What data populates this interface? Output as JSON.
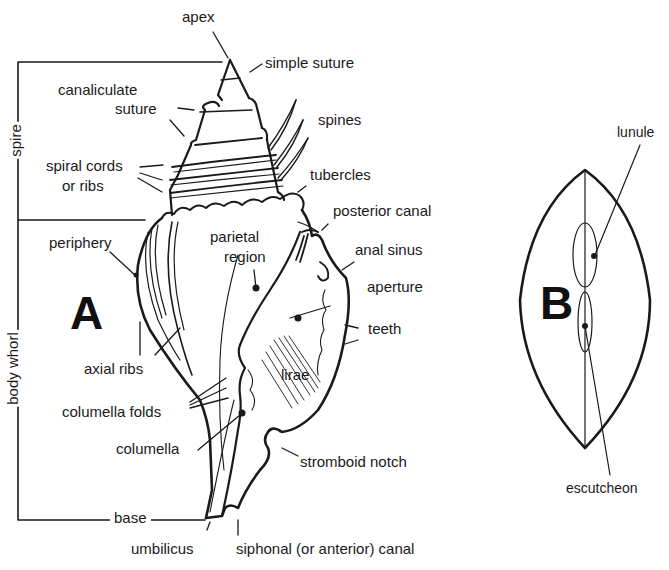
{
  "figure": {
    "panel_a": {
      "letter": "A",
      "labels": {
        "apex": "apex",
        "simple_suture": "simple suture",
        "canaliculate_suture_1": "canaliculate",
        "canaliculate_suture_2": "suture",
        "spines": "spines",
        "spiral_cords_1": "spiral cords",
        "spiral_cords_2": "or ribs",
        "tubercles": "tubercles",
        "posterior_canal": "posterior canal",
        "periphery": "periphery",
        "parietal_region_1": "parietal",
        "parietal_region_2": "region",
        "anal_sinus": "anal sinus",
        "aperture": "aperture",
        "teeth": "teeth",
        "axial_ribs": "axial ribs",
        "lirae": "lirae",
        "columella_folds": "columella folds",
        "columella": "columella",
        "stromboid_notch": "stromboid notch",
        "base": "base",
        "umbilicus": "umbilicus",
        "siphonal_canal": "siphonal (or anterior) canal"
      },
      "brackets": {
        "spire": "spire",
        "body_whorl": "body whorl"
      }
    },
    "panel_b": {
      "letter": "B",
      "labels": {
        "lunule": "lunule",
        "escutcheon": "escutcheon"
      }
    },
    "colors": {
      "ink": "#1a1a1a",
      "background": "#ffffff"
    }
  }
}
